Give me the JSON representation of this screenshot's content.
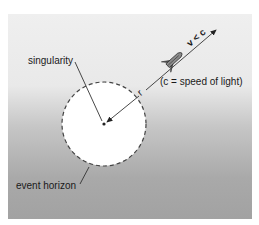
{
  "diagram": {
    "labels": {
      "singularity": "singularity",
      "event_horizon": "event horizon",
      "radius": "r",
      "velocity": "v < c",
      "speed_note": "(c = speed of light)"
    },
    "icons": {
      "rocket": "rocket-icon"
    },
    "colors": {
      "background_top": "#efefef",
      "background_bottom": "#a2a2a2",
      "horizon_fill": "#ffffff",
      "stroke": "#333333"
    }
  }
}
